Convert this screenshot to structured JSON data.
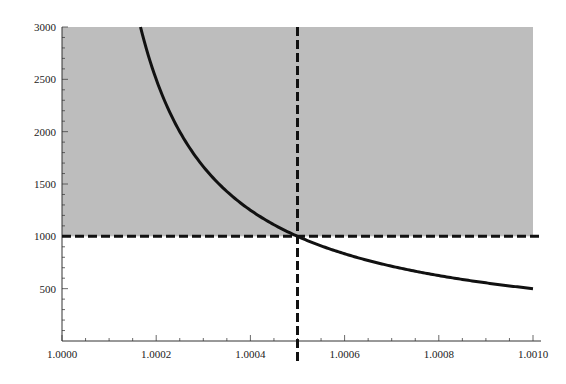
{
  "chart_data": {
    "type": "line",
    "title": "",
    "xlabel": "",
    "ylabel": "",
    "xlim": [
      1.0,
      1.001
    ],
    "ylim": [
      0,
      3000
    ],
    "grid": false,
    "legend": null,
    "x_ticks": [
      "1.0000",
      "1.0002",
      "1.0004",
      "1.0006",
      "1.0008",
      "1.0010"
    ],
    "x_tick_values": [
      1.0,
      1.0002,
      1.0004,
      1.0006,
      1.0008,
      1.001
    ],
    "y_ticks": [
      "500",
      "1000",
      "1500",
      "2000",
      "2500",
      "3000"
    ],
    "y_tick_values": [
      500,
      1000,
      1500,
      2000,
      2500,
      3000
    ],
    "series": [
      {
        "name": "curve",
        "formula": "y = 0.5 / (x - 1)",
        "color": "#111111",
        "x": [
          1.0001667,
          1.0002,
          1.00025,
          1.0003,
          1.00035,
          1.0004,
          1.00045,
          1.0005,
          1.0006,
          1.0007,
          1.0008,
          1.0009,
          1.001
        ],
        "y": [
          3000,
          2500,
          2000,
          1667,
          1429,
          1250,
          1111,
          1000,
          833,
          714,
          625,
          556,
          500
        ]
      }
    ],
    "reference_lines": [
      {
        "orientation": "horizontal",
        "value": 1000,
        "style": "dashed",
        "color": "#111111"
      },
      {
        "orientation": "vertical",
        "value": 1.0005,
        "style": "dashed",
        "color": "#111111"
      }
    ],
    "shaded_region": {
      "y_from": 1000,
      "y_to": 3000,
      "x_from": 1.0,
      "x_to": 1.001,
      "color": "#bdbdbd"
    }
  }
}
